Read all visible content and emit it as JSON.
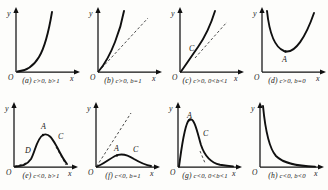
{
  "figure": {
    "axis_labels": {
      "y": "y",
      "x": "x",
      "origin": "O"
    },
    "rows": 2,
    "columns": 4
  },
  "panels": [
    {
      "id": "a",
      "tag": "(a)",
      "condition": "c>0, b>1",
      "caption": "(a) c>0, b>1",
      "shape": "convex-increasing-exponential",
      "has_dashed_asymptote": false,
      "point_labels": []
    },
    {
      "id": "b",
      "tag": "(b)",
      "condition": "c>0, b=1",
      "caption": "(b) c>0, b=1",
      "shape": "increasing-above-line",
      "has_dashed_asymptote": true,
      "point_labels": []
    },
    {
      "id": "c",
      "tag": "(c)",
      "condition": "c>0, 0<b<1",
      "caption": "(c) c>0, 0<b<1",
      "shape": "increasing-with-inflection",
      "has_dashed_asymptote": true,
      "point_labels": [
        {
          "label": "C",
          "role": "inflection-point"
        }
      ]
    },
    {
      "id": "d",
      "tag": "(d)",
      "condition": "c>0, b=0",
      "caption": "(d) c>0, b=0",
      "shape": "u-shaped-minimum",
      "has_dashed_asymptote": false,
      "point_labels": [
        {
          "label": "A",
          "role": "minimum-point"
        }
      ]
    },
    {
      "id": "e",
      "tag": "(e)",
      "condition": "c<0, b>1",
      "caption": "(e) c<0, b>1",
      "shape": "bell-shaped-maximum",
      "has_dashed_asymptote": true,
      "point_labels": [
        {
          "label": "D",
          "role": "lower-inflection-point"
        },
        {
          "label": "A",
          "role": "maximum-point"
        },
        {
          "label": "C",
          "role": "upper-inflection-point"
        }
      ]
    },
    {
      "id": "f",
      "tag": "(f)",
      "condition": "c<0, b=1",
      "caption": "(f) c<0, b=1",
      "shape": "low-hump-with-tangent",
      "has_dashed_asymptote": true,
      "point_labels": [
        {
          "label": "A",
          "role": "maximum-point"
        },
        {
          "label": "C",
          "role": "inflection-point"
        }
      ]
    },
    {
      "id": "g",
      "tag": "(g)",
      "condition": "c<0, 0<b<1",
      "caption": "(g) c<0, 0<b<1",
      "shape": "sharp-peak-decaying-tail",
      "has_dashed_asymptote": true,
      "point_labels": [
        {
          "label": "A",
          "role": "maximum-point"
        },
        {
          "label": "C",
          "role": "inflection-point"
        }
      ]
    },
    {
      "id": "h",
      "tag": "(h)",
      "condition": "c<0, b<0",
      "caption": "(h) c<0, b<0",
      "shape": "hyperbolic-decay",
      "has_dashed_asymptote": false,
      "point_labels": []
    }
  ]
}
